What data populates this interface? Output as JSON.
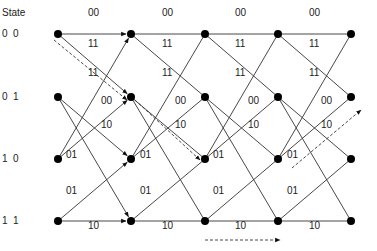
{
  "header": {
    "state_label": "State"
  },
  "states": [
    {
      "label": "0  0",
      "y": 34
    },
    {
      "label": "0  1",
      "y": 97
    },
    {
      "label": "1  0",
      "y": 159
    },
    {
      "label": "1  1",
      "y": 221
    }
  ],
  "columns_x": [
    58,
    131,
    205,
    278,
    351
  ],
  "transitions": [
    {
      "from": 0,
      "to": 0,
      "output": "00"
    },
    {
      "from": 0,
      "to": 1,
      "output": "11"
    },
    {
      "from": 1,
      "to": 2,
      "output": "00"
    },
    {
      "from": 1,
      "to": 3,
      "output": "11"
    },
    {
      "from": 2,
      "to": 0,
      "output": "11"
    },
    {
      "from": 2,
      "to": 1,
      "output": "00"
    },
    {
      "from": 3,
      "to": 2,
      "output": "01"
    },
    {
      "from": 3,
      "to": 3,
      "output": "10"
    }
  ],
  "edge_labels": [
    {
      "text": "00",
      "x": 88,
      "y": 13
    },
    {
      "text": "00",
      "x": 162,
      "y": 13
    },
    {
      "text": "00",
      "x": 235,
      "y": 13
    },
    {
      "text": "00",
      "x": 309,
      "y": 13
    },
    {
      "text": "11",
      "x": 88,
      "y": 44
    },
    {
      "text": "11",
      "x": 162,
      "y": 44
    },
    {
      "text": "11",
      "x": 235,
      "y": 44
    },
    {
      "text": "11",
      "x": 309,
      "y": 44
    },
    {
      "text": "11",
      "x": 88,
      "y": 73
    },
    {
      "text": "11",
      "x": 162,
      "y": 73
    },
    {
      "text": "11",
      "x": 235,
      "y": 73
    },
    {
      "text": "11",
      "x": 309,
      "y": 73
    },
    {
      "text": "00",
      "x": 101,
      "y": 101
    },
    {
      "text": "00",
      "x": 175,
      "y": 101
    },
    {
      "text": "00",
      "x": 248,
      "y": 101
    },
    {
      "text": "00",
      "x": 321,
      "y": 101
    },
    {
      "text": "10",
      "x": 101,
      "y": 125
    },
    {
      "text": "10",
      "x": 175,
      "y": 125
    },
    {
      "text": "10",
      "x": 248,
      "y": 125
    },
    {
      "text": "10",
      "x": 321,
      "y": 125
    },
    {
      "text": "01",
      "x": 66,
      "y": 155
    },
    {
      "text": "01",
      "x": 140,
      "y": 155
    },
    {
      "text": "01",
      "x": 213,
      "y": 155
    },
    {
      "text": "01",
      "x": 287,
      "y": 155
    },
    {
      "text": "01",
      "x": 66,
      "y": 191
    },
    {
      "text": "01",
      "x": 140,
      "y": 191
    },
    {
      "text": "01",
      "x": 213,
      "y": 191
    },
    {
      "text": "01",
      "x": 287,
      "y": 191
    },
    {
      "text": "10",
      "x": 88,
      "y": 226
    },
    {
      "text": "10",
      "x": 162,
      "y": 226
    },
    {
      "text": "10",
      "x": 235,
      "y": 226
    },
    {
      "text": "10",
      "x": 309,
      "y": 226
    }
  ],
  "dashed_paths": [
    {
      "points": [
        [
          54,
          40
        ],
        [
          127,
          100
        ]
      ],
      "arrow": true
    },
    {
      "points": [
        [
          135,
          100
        ],
        [
          200,
          160
        ]
      ],
      "arrow": true
    },
    {
      "points": [
        [
          292,
          168
        ],
        [
          361,
          110
        ]
      ],
      "arrow": true
    },
    {
      "points": [
        [
          205,
          240
        ],
        [
          280,
          240
        ]
      ],
      "arrow": true
    }
  ],
  "colors": {
    "line": "#333333",
    "node": "#000000",
    "dashed": "#333333"
  }
}
